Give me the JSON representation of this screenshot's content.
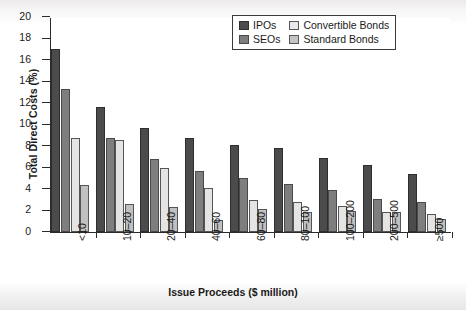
{
  "chart_data": {
    "type": "bar",
    "title": "",
    "xlabel": "Issue Proceeds ($ million)",
    "ylabel": "Total Direct Costs (%)",
    "ylim": [
      0,
      20
    ],
    "ytick_step": 2,
    "yticks": [
      "20",
      "18",
      "16",
      "14",
      "12",
      "10",
      "8",
      "6",
      "4",
      "2",
      "0"
    ],
    "grid": false,
    "legend_position": "top-right",
    "categories": [
      "<10",
      "10–20",
      "20–40",
      "40–60",
      "60–80",
      "80–100",
      "100–200",
      "200–500",
      "≥500"
    ],
    "series": [
      {
        "name": "IPOs",
        "color": "#4b4b4b",
        "values": [
          17.0,
          11.6,
          9.7,
          8.7,
          8.1,
          7.8,
          6.9,
          6.2,
          5.4
        ]
      },
      {
        "name": "SEOs",
        "color": "#7e7e7e",
        "values": [
          13.3,
          8.7,
          6.8,
          5.7,
          5.0,
          4.5,
          3.9,
          3.1,
          2.8
        ]
      },
      {
        "name": "Convertible Bonds",
        "color": "#e4e4e4",
        "values": [
          8.7,
          8.6,
          6.0,
          4.1,
          3.0,
          2.8,
          2.4,
          1.9,
          1.7
        ]
      },
      {
        "name": "Standard Bonds",
        "color": "#c0c0c0",
        "values": [
          4.4,
          2.6,
          2.3,
          1.1,
          2.1,
          1.9,
          2.0,
          1.9,
          1.2
        ]
      }
    ]
  },
  "legend": {
    "items": [
      {
        "label": "IPOs"
      },
      {
        "label": "Convertible Bonds"
      },
      {
        "label": "SEOs"
      },
      {
        "label": "Standard Bonds"
      }
    ]
  }
}
